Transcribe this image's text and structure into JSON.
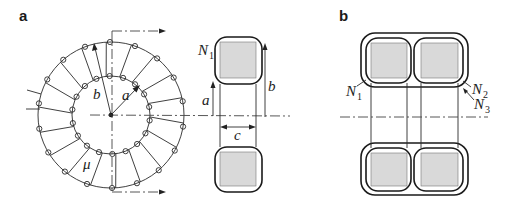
{
  "figure": {
    "panels": [
      {
        "id": "a",
        "label": "a",
        "toroid": {
          "center": [
            111,
            115
          ],
          "inner_radius": 39,
          "outer_radius": 73,
          "winding_count": 18,
          "labels": {
            "inner_radius": "a",
            "outer_radius": "b",
            "permeability": "μ"
          }
        },
        "cross_section": {
          "winding_label": "N",
          "winding_sub": "1",
          "dimension_labels": {
            "inner_radius": "a",
            "outer_radius": "b",
            "width": "c"
          }
        }
      },
      {
        "id": "b",
        "label": "b",
        "windings": [
          {
            "label": "N",
            "sub": "1"
          },
          {
            "label": "N",
            "sub": "2"
          },
          {
            "label": "N",
            "sub": "3"
          }
        ]
      }
    ],
    "colors": {
      "line": "#2a2a2a",
      "core_fill": "#d9d9d9",
      "background": "#ffffff"
    }
  }
}
